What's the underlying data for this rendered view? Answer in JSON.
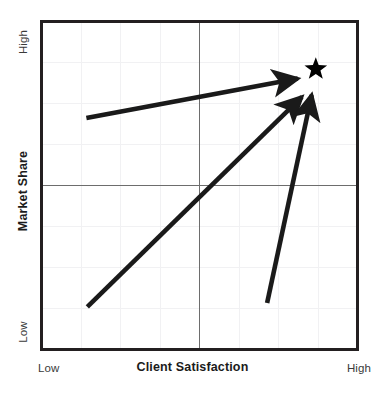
{
  "chart_data": {
    "type": "scatter",
    "title": "",
    "subtitle": "",
    "xlabel": "Client Satisfaction",
    "ylabel": "Market Share",
    "xlim": [
      0,
      1
    ],
    "ylim": [
      0,
      1
    ],
    "x_tick_labels": [
      "Low",
      "High"
    ],
    "y_tick_labels": [
      "Low",
      "High"
    ],
    "grid": true,
    "grid_divisions": 8,
    "legend": "none",
    "center_crosshair": {
      "x": 0.5,
      "y": 0.5
    },
    "markers": [
      {
        "name": "target-star",
        "symbol": "star",
        "x": 0.868,
        "y": 0.855,
        "color": "#000000"
      }
    ],
    "arrows": [
      {
        "name": "shallow-arrow",
        "label": "",
        "from": {
          "x": 0.142,
          "y": 0.706
        },
        "to": {
          "x": 0.811,
          "y": 0.826
        },
        "color": "#1a1a1a"
      },
      {
        "name": "diagonal-arrow",
        "label": "",
        "from": {
          "x": 0.145,
          "y": 0.13
        },
        "to": {
          "x": 0.824,
          "y": 0.77
        },
        "color": "#1a1a1a"
      },
      {
        "name": "steep-arrow",
        "label": "",
        "from": {
          "x": 0.714,
          "y": 0.142
        },
        "to": {
          "x": 0.855,
          "y": 0.776
        },
        "color": "#1a1a1a"
      }
    ],
    "colors": {
      "frame": "#231f20",
      "gridline": "#f0f0f2",
      "crosshair": "#6d6d6d",
      "arrow": "#1a1a1a",
      "marker": "#000000",
      "background": "#ffffff",
      "tick_text": "#3a3a3a",
      "title_text": "#1b1b1b"
    }
  },
  "axes": {
    "x": {
      "title": "Client Satisfaction",
      "low_label": "Low",
      "high_label": "High"
    },
    "y": {
      "title": "Market Share",
      "low_label": "Low",
      "high_label": "High"
    }
  }
}
